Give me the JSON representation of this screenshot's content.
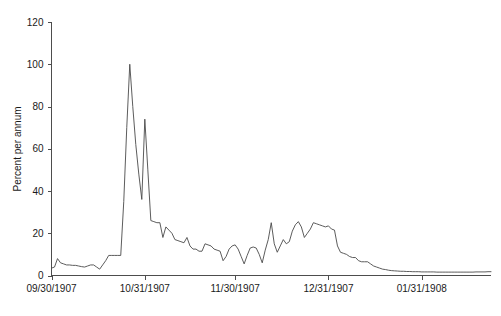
{
  "chart_data": {
    "type": "line",
    "title": "",
    "subtitle": "",
    "xlabel": "",
    "ylabel": "Percent per annum",
    "ylim": [
      0,
      120
    ],
    "yticks": [
      0,
      20,
      40,
      60,
      80,
      100,
      120
    ],
    "ytick_labels": [
      "0",
      "20",
      "40",
      "60",
      "80",
      "100",
      "120"
    ],
    "xtick_labels": [
      "09/30/1907",
      "10/31/1907",
      "11/30/1907",
      "12/31/1907",
      "01/31/1908"
    ],
    "xtick_positions": [
      0,
      31,
      61,
      92,
      123
    ],
    "xlim": [
      0,
      146
    ],
    "grid": false,
    "legend": null,
    "legend_position": "none",
    "series": [
      {
        "name": "Call money rate",
        "x": [
          0,
          1,
          2,
          3,
          4,
          5,
          6,
          7,
          8,
          9,
          10,
          11,
          12,
          13,
          14,
          15,
          16,
          17,
          18,
          19,
          20,
          21,
          22,
          23,
          24,
          25,
          26,
          27,
          28,
          29,
          30,
          31,
          32,
          33,
          34,
          35,
          36,
          37,
          38,
          39,
          40,
          41,
          42,
          43,
          44,
          45,
          46,
          47,
          48,
          49,
          50,
          51,
          52,
          53,
          54,
          55,
          56,
          57,
          58,
          59,
          60,
          61,
          62,
          63,
          64,
          65,
          66,
          67,
          68,
          69,
          70,
          71,
          72,
          73,
          74,
          75,
          76,
          77,
          78,
          79,
          80,
          81,
          82,
          83,
          84,
          85,
          86,
          87,
          88,
          89,
          90,
          91,
          92,
          93,
          94,
          95,
          96,
          97,
          98,
          99,
          100,
          101,
          102,
          103,
          104,
          105,
          106,
          107,
          108,
          109,
          110,
          111,
          112,
          113,
          114,
          115,
          116,
          117,
          118,
          119,
          120,
          121,
          122,
          123,
          124,
          125,
          126,
          127,
          128,
          129,
          130,
          131,
          132,
          133,
          134,
          135,
          136,
          137,
          138,
          139,
          140,
          141,
          142,
          143,
          144,
          145,
          146
        ],
        "values": [
          3.5,
          4.0,
          8.0,
          6.0,
          5.5,
          5.0,
          5.0,
          4.8,
          4.8,
          4.5,
          4.2,
          4.0,
          4.5,
          5.0,
          5.0,
          4.0,
          3.0,
          5.0,
          7.0,
          9.5,
          9.5,
          9.5,
          9.5,
          9.5,
          35.0,
          70.0,
          100.0,
          80.0,
          62.0,
          48.0,
          36.0,
          74.0,
          50.0,
          26.0,
          25.5,
          25.0,
          25.0,
          18.0,
          23.0,
          21.5,
          20.0,
          17.0,
          16.5,
          16.0,
          15.5,
          18.0,
          14.0,
          12.5,
          12.5,
          11.5,
          11.5,
          15.0,
          14.5,
          14.0,
          12.5,
          12.0,
          11.5,
          7.0,
          9.0,
          12.5,
          14.0,
          14.5,
          12.5,
          9.0,
          5.5,
          9.5,
          13.0,
          13.5,
          13.0,
          10.0,
          6.0,
          12.0,
          17.0,
          25.0,
          15.0,
          11.0,
          14.0,
          17.0,
          15.0,
          16.0,
          21.0,
          24.0,
          25.5,
          23.0,
          18.0,
          20.0,
          22.0,
          25.0,
          24.5,
          24.0,
          23.5,
          23.0,
          23.5,
          22.0,
          21.5,
          14.0,
          11.0,
          10.5,
          10.0,
          9.0,
          8.5,
          8.5,
          7.0,
          6.5,
          6.5,
          6.5,
          5.5,
          4.5,
          4.0,
          3.5,
          3.0,
          2.8,
          2.5,
          2.3,
          2.2,
          2.1,
          2.0,
          2.0,
          1.9,
          1.9,
          1.8,
          1.8,
          1.8,
          1.7,
          1.7,
          1.7,
          1.7,
          1.7,
          1.6,
          1.6,
          1.6,
          1.6,
          1.6,
          1.6,
          1.6,
          1.6,
          1.6,
          1.6,
          1.6,
          1.6,
          1.6,
          1.7,
          1.7,
          1.7,
          1.7,
          1.8,
          1.8
        ]
      }
    ]
  },
  "figure": {
    "axis_color": "#4d4d4d",
    "line_color": "#4a4a4a",
    "background": "#ffffff"
  }
}
